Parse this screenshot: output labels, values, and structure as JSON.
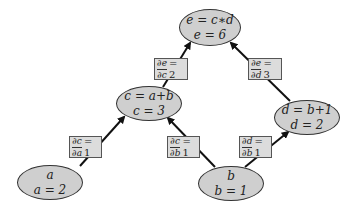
{
  "nodes": {
    "e": {
      "expr": "e = c∗d",
      "value": "e = 6"
    },
    "c": {
      "expr": "c = a+b",
      "value": "c = 3"
    },
    "d": {
      "expr": "d = b+1",
      "value": "d = 2"
    },
    "a": {
      "expr": "a",
      "value": "a = 2"
    },
    "b": {
      "expr": "b",
      "value": "b = 1"
    }
  },
  "edges": {
    "de_dc": {
      "num": "∂e",
      "den": "∂c",
      "value": "= 2"
    },
    "de_dd": {
      "num": "∂e",
      "den": "∂d",
      "value": "= 3"
    },
    "dc_da": {
      "num": "∂c",
      "den": "∂a",
      "value": "= 1"
    },
    "dc_db": {
      "num": "∂c",
      "den": "∂b",
      "value": "= 1"
    },
    "dd_db": {
      "num": "∂d",
      "den": "∂b",
      "value": "= 1"
    }
  },
  "colors": {
    "node_fill": "#cfcfcf",
    "label_fill": "#dcdcdc",
    "arrow": "#111111"
  }
}
